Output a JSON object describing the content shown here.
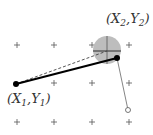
{
  "diagram": {
    "labels": {
      "start": {
        "open": "(X",
        "sub1": "1",
        "mid": ",Y",
        "sub2": "1",
        "close": ")"
      },
      "end": {
        "open": "(X",
        "sub1": "2",
        "mid": ",Y",
        "sub2": "2",
        "close": ")"
      }
    },
    "grid": {
      "xs": [
        17,
        54,
        92,
        129
      ],
      "ys": [
        45,
        83,
        122
      ],
      "color": "#555555"
    },
    "points": {
      "start": {
        "x": 16,
        "y": 84
      },
      "end": {
        "x": 117,
        "y": 58
      },
      "target": {
        "x": 107,
        "y": 50
      },
      "hanging": {
        "x": 128,
        "y": 110
      }
    },
    "target_circle": {
      "radius": 14,
      "fill": "#bdbdbd"
    },
    "colors": {
      "main_line": "#000000",
      "dashed_line": "#444444",
      "thin_line": "#666666"
    }
  }
}
